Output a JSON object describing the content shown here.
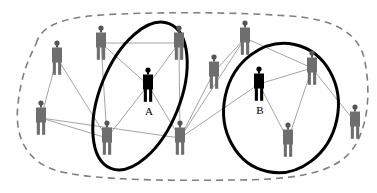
{
  "diagram": {
    "type": "node-link-network",
    "canvas": {
      "width": 377,
      "height": 193,
      "background": "#ffffff"
    },
    "colors": {
      "background": "#ffffff",
      "node_normal": "#6e6e6e",
      "node_normal_dark": "#555555",
      "node_highlight": "#000000",
      "edge": "#9a9a9a",
      "boundary_dashed": "#808080",
      "cluster_outline": "#000000",
      "label": "#000000"
    },
    "outer_boundary": {
      "name": "network-boundary",
      "style": "dashed",
      "stroke": "#808080",
      "stroke_width": 1.6,
      "dash": "7 5",
      "shape": "rounded-blob"
    },
    "clusters": [
      {
        "id": "cluster-a",
        "label": "A",
        "style": "solid-ellipse",
        "stroke": "#000000",
        "stroke_width": 3,
        "cx": 140,
        "cy": 96,
        "rx": 40,
        "ry": 78,
        "rotation": 22
      },
      {
        "id": "cluster-b",
        "label": "B",
        "style": "solid-ellipse",
        "stroke": "#000000",
        "stroke_width": 3,
        "cx": 281,
        "cy": 108,
        "rx": 57,
        "ry": 65,
        "rotation": 12
      }
    ],
    "nodes": [
      {
        "id": "n1",
        "x": 57,
        "y": 62,
        "shade": "normal",
        "label": ""
      },
      {
        "id": "n2",
        "x": 101,
        "y": 47,
        "shade": "normal",
        "label": ""
      },
      {
        "id": "n3",
        "x": 179,
        "y": 47,
        "shade": "normal",
        "label": ""
      },
      {
        "id": "n4",
        "x": 245,
        "y": 42,
        "shade": "normal",
        "label": ""
      },
      {
        "id": "n5",
        "x": 41,
        "y": 122,
        "shade": "normal",
        "label": ""
      },
      {
        "id": "n6",
        "x": 148,
        "y": 89,
        "shade": "highlight",
        "label": "A"
      },
      {
        "id": "n7",
        "x": 214,
        "y": 76,
        "shade": "normal",
        "label": ""
      },
      {
        "id": "n8",
        "x": 259,
        "y": 88,
        "shade": "highlight",
        "label": "B"
      },
      {
        "id": "n9",
        "x": 312,
        "y": 72,
        "shade": "normal",
        "label": ""
      },
      {
        "id": "n10",
        "x": 107,
        "y": 142,
        "shade": "normal",
        "label": ""
      },
      {
        "id": "n11",
        "x": 180,
        "y": 142,
        "shade": "normal",
        "label": ""
      },
      {
        "id": "n12",
        "x": 288,
        "y": 144,
        "shade": "normal",
        "label": ""
      },
      {
        "id": "n13",
        "x": 355,
        "y": 126,
        "shade": "normal",
        "label": ""
      }
    ],
    "edges": [
      {
        "from": "n2",
        "to": "n3"
      },
      {
        "from": "n2",
        "to": "n6"
      },
      {
        "from": "n2",
        "to": "n10"
      },
      {
        "from": "n1",
        "to": "n5"
      },
      {
        "from": "n1",
        "to": "n10"
      },
      {
        "from": "n5",
        "to": "n10"
      },
      {
        "from": "n5",
        "to": "n11"
      },
      {
        "from": "n3",
        "to": "n6"
      },
      {
        "from": "n3",
        "to": "n11"
      },
      {
        "from": "n6",
        "to": "n10"
      },
      {
        "from": "n6",
        "to": "n11"
      },
      {
        "from": "n4",
        "to": "n7"
      },
      {
        "from": "n4",
        "to": "n9"
      },
      {
        "from": "n4",
        "to": "n11"
      },
      {
        "from": "n7",
        "to": "n11"
      },
      {
        "from": "n8",
        "to": "n9"
      },
      {
        "from": "n8",
        "to": "n11"
      },
      {
        "from": "n8",
        "to": "n12"
      },
      {
        "from": "n9",
        "to": "n12"
      },
      {
        "from": "n9",
        "to": "n13"
      }
    ]
  }
}
